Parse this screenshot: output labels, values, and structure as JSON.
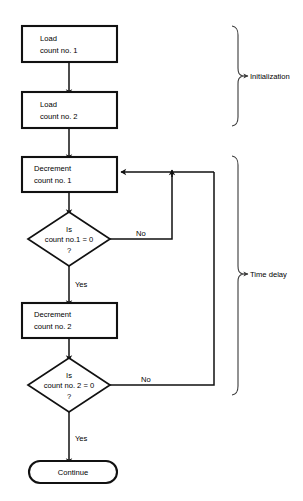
{
  "diagram": {
    "type": "flowchart",
    "background_color": "#ffffff",
    "line_color": "#111111",
    "nodes": [
      {
        "id": "load1",
        "shape": "process",
        "lines": [
          "Load",
          "count no. 1"
        ]
      },
      {
        "id": "load2",
        "shape": "process",
        "lines": [
          "Load",
          "count no. 2"
        ]
      },
      {
        "id": "dec1",
        "shape": "process",
        "lines": [
          "Decrement",
          "count no. 1"
        ]
      },
      {
        "id": "test1",
        "shape": "decision",
        "lines": [
          "Is",
          "count no.1 = 0",
          "?"
        ]
      },
      {
        "id": "dec2",
        "shape": "process",
        "lines": [
          "Decrement",
          "count no. 2"
        ]
      },
      {
        "id": "test2",
        "shape": "decision",
        "lines": [
          "Is",
          "count no. 2 = 0",
          "?"
        ]
      },
      {
        "id": "continue",
        "shape": "terminator",
        "lines": [
          "Continue"
        ]
      }
    ],
    "edge_labels": {
      "test1_no": "No",
      "test1_yes": "Yes",
      "test2_no": "No",
      "test2_yes": "Yes"
    },
    "braces": [
      {
        "id": "initialization",
        "label": "Initialization"
      },
      {
        "id": "time_delay",
        "label": "Time delay"
      }
    ]
  }
}
